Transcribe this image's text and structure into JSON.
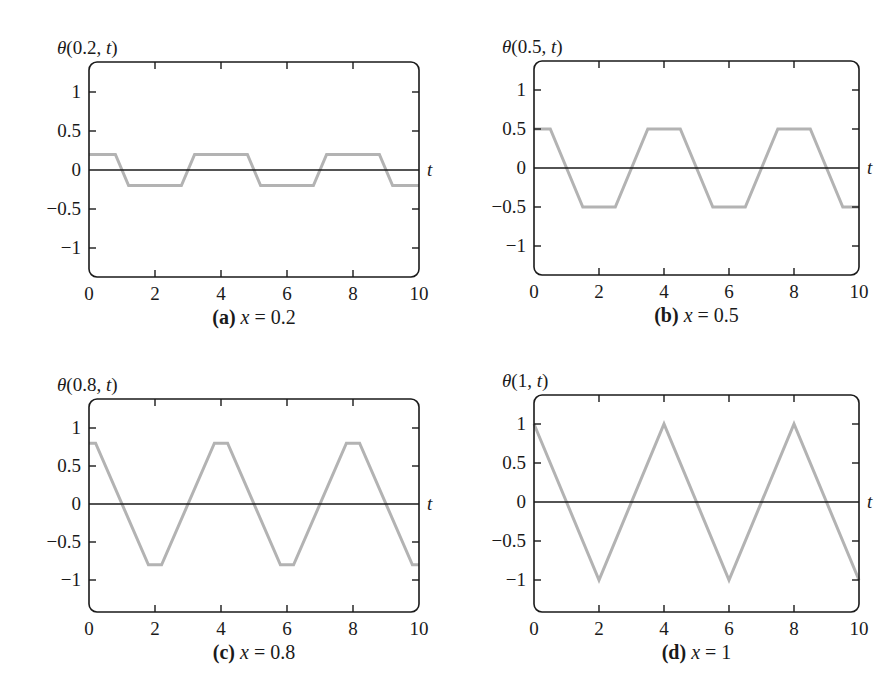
{
  "figure": {
    "panels": [
      {
        "id": "a",
        "ylabel": "θ(0.2, t)",
        "ylabel_parts": {
          "prefix": "θ(0.2, ",
          "var": "t",
          "suffix": ")"
        },
        "caption": {
          "tag": "(a)",
          "var": "x",
          "rest": " = 0.2"
        },
        "xaxis_label": "t"
      },
      {
        "id": "b",
        "ylabel": "θ(0.5, t)",
        "ylabel_parts": {
          "prefix": "θ(0.5, ",
          "var": "t",
          "suffix": ")"
        },
        "caption": {
          "tag": "(b)",
          "var": "x",
          "rest": " = 0.5"
        },
        "xaxis_label": "t"
      },
      {
        "id": "c",
        "ylabel": "θ(0.8, t)",
        "ylabel_parts": {
          "prefix": "θ(0.8, ",
          "var": "t",
          "suffix": ")"
        },
        "caption": {
          "tag": "(c)",
          "var": "x",
          "rest": " = 0.8"
        },
        "xaxis_label": "t"
      },
      {
        "id": "d",
        "ylabel": "θ(1, t)",
        "ylabel_parts": {
          "prefix": "θ(1, ",
          "var": "t",
          "suffix": ")"
        },
        "caption": {
          "tag": "(d)",
          "var": "x",
          "rest": " = 1"
        },
        "xaxis_label": "t"
      }
    ],
    "colors": {
      "axis": "#1a1a1a",
      "curve": "#b3b3b3",
      "background": "#ffffff"
    }
  },
  "chart_data": [
    {
      "type": "line",
      "title": "(a) x = 0.2",
      "xlabel": "t",
      "ylabel": "θ(0.2, t)",
      "xlim": [
        0,
        10
      ],
      "ylim": [
        -1.3,
        1.3
      ],
      "xticks": [
        0,
        2,
        4,
        6,
        8,
        10
      ],
      "yticks": [
        1,
        0.5,
        0,
        -0.5,
        -1
      ],
      "ytick_labels": [
        "1",
        "0.5",
        "0",
        "−0.5",
        "−1"
      ],
      "grid": false,
      "zero_line": true,
      "series": [
        {
          "name": "θ(0.2, t)",
          "x": [
            0,
            0.8,
            1.2,
            2.8,
            3.2,
            4.8,
            5.2,
            6.8,
            7.2,
            8.8,
            9.2,
            10
          ],
          "y": [
            0.2,
            0.2,
            -0.2,
            -0.2,
            0.2,
            0.2,
            -0.2,
            -0.2,
            0.2,
            0.2,
            -0.2,
            -0.2
          ]
        }
      ]
    },
    {
      "type": "line",
      "title": "(b) x = 0.5",
      "xlabel": "t",
      "ylabel": "θ(0.5, t)",
      "xlim": [
        0,
        10
      ],
      "ylim": [
        -1.3,
        1.3
      ],
      "xticks": [
        0,
        2,
        4,
        6,
        8,
        10
      ],
      "yticks": [
        1,
        0.5,
        0,
        -0.5,
        -1
      ],
      "ytick_labels": [
        "1",
        "0.5",
        "0",
        "−0.5",
        "−1"
      ],
      "grid": false,
      "zero_line": true,
      "series": [
        {
          "name": "θ(0.5, t)",
          "x": [
            0,
            0.5,
            1.5,
            2.5,
            3.5,
            4.5,
            5.5,
            6.5,
            7.5,
            8.5,
            9.5,
            10
          ],
          "y": [
            0.5,
            0.5,
            -0.5,
            -0.5,
            0.5,
            0.5,
            -0.5,
            -0.5,
            0.5,
            0.5,
            -0.5,
            -0.5
          ]
        }
      ]
    },
    {
      "type": "line",
      "title": "(c) x = 0.8",
      "xlabel": "t",
      "ylabel": "θ(0.8, t)",
      "xlim": [
        0,
        10
      ],
      "ylim": [
        -1.3,
        1.3
      ],
      "xticks": [
        0,
        2,
        4,
        6,
        8,
        10
      ],
      "yticks": [
        1,
        0.5,
        0,
        -0.5,
        -1
      ],
      "ytick_labels": [
        "1",
        "0.5",
        "0",
        "−0.5",
        "−1"
      ],
      "grid": false,
      "zero_line": true,
      "series": [
        {
          "name": "θ(0.8, t)",
          "x": [
            0,
            0.2,
            1.8,
            2.2,
            3.8,
            4.2,
            5.8,
            6.2,
            7.8,
            8.2,
            9.8,
            10
          ],
          "y": [
            0.8,
            0.8,
            -0.8,
            -0.8,
            0.8,
            0.8,
            -0.8,
            -0.8,
            0.8,
            0.8,
            -0.8,
            -0.8
          ]
        }
      ]
    },
    {
      "type": "line",
      "title": "(d) x = 1",
      "xlabel": "t",
      "ylabel": "θ(1, t)",
      "xlim": [
        0,
        10
      ],
      "ylim": [
        -1.3,
        1.3
      ],
      "xticks": [
        0,
        2,
        4,
        6,
        8,
        10
      ],
      "yticks": [
        1,
        0.5,
        0,
        -0.5,
        -1
      ],
      "ytick_labels": [
        "1",
        "0.5",
        "0",
        "−0.5",
        "−1"
      ],
      "grid": false,
      "zero_line": true,
      "series": [
        {
          "name": "θ(1, t)",
          "x": [
            0,
            2,
            4,
            6,
            8,
            10
          ],
          "y": [
            1,
            -1,
            1,
            -1,
            1,
            -1
          ]
        }
      ]
    }
  ],
  "layout": {
    "panels": [
      {
        "x0": 89,
        "x1": 419,
        "top": 62,
        "bottom": 277,
        "y_at_1": 92,
        "y_at_0": 170
      },
      {
        "x0": 534,
        "x1": 859,
        "top": 61,
        "bottom": 275,
        "y_at_1": 90,
        "y_at_0": 168
      },
      {
        "x0": 89,
        "x1": 419,
        "top": 399,
        "bottom": 612,
        "y_at_1": 428,
        "y_at_0": 504
      },
      {
        "x0": 534,
        "x1": 859,
        "top": 395,
        "bottom": 612,
        "y_at_1": 424,
        "y_at_0": 502
      }
    ]
  }
}
